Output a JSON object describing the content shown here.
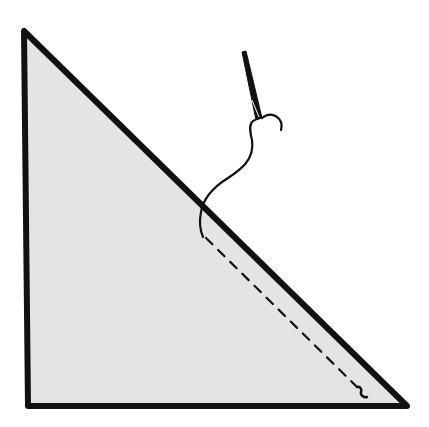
{
  "diagram": {
    "canvas": {
      "width": 429,
      "height": 427,
      "background": "#ffffff"
    },
    "fabric_triangle": {
      "vertices": [
        [
          24,
          31
        ],
        [
          28,
          406
        ],
        [
          407,
          406
        ]
      ],
      "fill": "#e4e4e4",
      "stroke": "#111111",
      "stroke_width": 6
    },
    "seam_line": {
      "style": "dashed",
      "from": [
        203,
        236
      ],
      "to": [
        360,
        394
      ],
      "stroke": "#111111"
    },
    "thread": {
      "stroke": "#111111",
      "description": "thread running from needle eye down through the diagonal edge"
    },
    "needle": {
      "tip": [
        243,
        53
      ],
      "eye": [
        258,
        118
      ],
      "stroke": "#111111"
    }
  }
}
